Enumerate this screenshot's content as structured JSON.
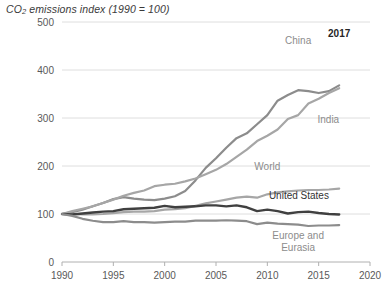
{
  "chart_data": {
    "type": "line",
    "title": "CO2 emissions index (1990 = 100)",
    "title_parts": {
      "pre": "CO",
      "sub": "2",
      "post": " emissions index (1990 = 100)"
    },
    "xlabel": "",
    "ylabel": "",
    "xlim": [
      1990,
      2020
    ],
    "ylim": [
      0,
      500
    ],
    "xticks": [
      "1990",
      "1995",
      "2000",
      "2005",
      "2010",
      "2015",
      "2020"
    ],
    "xtick_values": [
      1990,
      1995,
      2000,
      2005,
      2010,
      2015,
      2020
    ],
    "yticks": [
      "0",
      "100",
      "200",
      "300",
      "400",
      "500"
    ],
    "ytick_values": [
      0,
      100,
      200,
      300,
      400,
      500
    ],
    "grid": "horizontal",
    "legend_position": "inline-annotations",
    "annotations": [
      {
        "text": "2017",
        "x": 2017,
        "y": 468,
        "name": "end-year-annotation"
      }
    ],
    "x": [
      1990,
      1991,
      1992,
      1993,
      1994,
      1995,
      1996,
      1997,
      1998,
      1999,
      2000,
      2001,
      2002,
      2003,
      2004,
      2005,
      2006,
      2007,
      2008,
      2009,
      2010,
      2011,
      2012,
      2013,
      2014,
      2015,
      2016,
      2017
    ],
    "series": [
      {
        "name": "China",
        "color": "#8c8c8c",
        "width": 2.2,
        "label_x": 2013,
        "label_y": 455,
        "values": [
          100,
          104,
          109,
          116,
          123,
          131,
          135,
          132,
          130,
          129,
          132,
          137,
          148,
          170,
          196,
          216,
          238,
          258,
          268,
          287,
          306,
          336,
          348,
          358,
          356,
          352,
          356,
          368
        ]
      },
      {
        "name": "India",
        "color": "#a6a6a6",
        "width": 2.2,
        "label_x": 2017,
        "label_y": 290,
        "values": [
          100,
          106,
          111,
          116,
          123,
          130,
          138,
          144,
          149,
          158,
          161,
          163,
          168,
          174,
          183,
          192,
          204,
          219,
          234,
          252,
          263,
          276,
          298,
          306,
          330,
          340,
          352,
          362
        ]
      },
      {
        "name": "World",
        "color": "#a6a6a6",
        "width": 2.2,
        "label_x": 2010,
        "label_y": 192,
        "values": [
          100,
          100,
          99,
          99,
          100,
          102,
          104,
          105,
          105,
          106,
          109,
          110,
          112,
          117,
          122,
          126,
          130,
          134,
          136,
          134,
          141,
          145,
          147,
          149,
          150,
          150,
          151,
          153
        ]
      },
      {
        "name": "United States",
        "color": "#404040",
        "width": 2.4,
        "label_x": 2016,
        "label_y": 132,
        "values": [
          100,
          99,
          101,
          103,
          105,
          106,
          110,
          111,
          112,
          113,
          117,
          114,
          115,
          116,
          118,
          118,
          116,
          118,
          114,
          106,
          109,
          106,
          101,
          104,
          105,
          102,
          100,
          99
        ]
      },
      {
        "name": "Europe and Eurasia",
        "color": "#8c8c8c",
        "width": 2.2,
        "label_x": 2013,
        "label_y": 48,
        "label_lines": [
          "Europe and",
          "Eurasia"
        ],
        "values": [
          100,
          96,
          90,
          86,
          83,
          83,
          85,
          83,
          83,
          82,
          83,
          84,
          84,
          86,
          86,
          86,
          87,
          86,
          85,
          79,
          82,
          80,
          79,
          78,
          75,
          76,
          76,
          77
        ]
      }
    ]
  }
}
